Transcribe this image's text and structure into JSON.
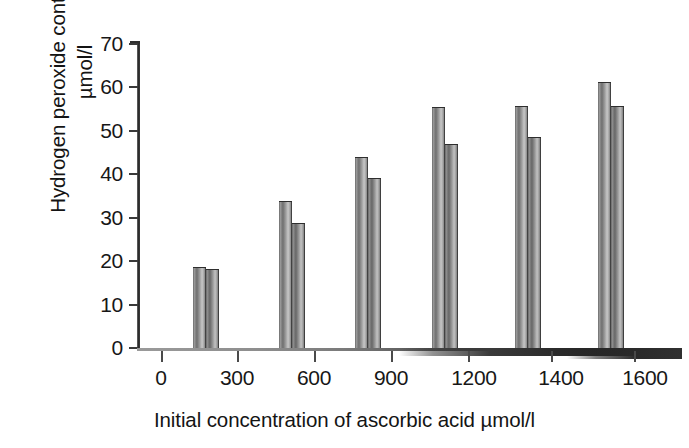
{
  "chart_data": {
    "type": "bar",
    "title": "",
    "subtitle": "",
    "ylabel_line1": "Hydrogen peroxide content of solution",
    "ylabel_line2": "µmol/l",
    "xlabel": "Initial concentration of ascorbic acid µmol/l",
    "categories": [
      "300",
      "600",
      "900",
      "1200",
      "1400",
      "1600"
    ],
    "xtick_labels": [
      "0",
      "300",
      "600",
      "900",
      "1200",
      "1400",
      "1600"
    ],
    "ytick_labels": [
      "0",
      "10",
      "20",
      "30",
      "40",
      "50",
      "60",
      "70"
    ],
    "ylim": [
      0,
      70
    ],
    "ytick_step": 10,
    "grid": false,
    "legend": "none",
    "series": [
      {
        "name": "series-1",
        "values": [
          18.4,
          33.6,
          43.8,
          55.3,
          55.5,
          61.0
        ]
      },
      {
        "name": "series-2",
        "values": [
          18.0,
          28.6,
          38.9,
          46.7,
          48.4,
          55.5
        ]
      }
    ],
    "colors": {
      "series_1": "#8f8f8f",
      "series_2": "#848484",
      "axis": "#2b2b2b",
      "text": "#171717"
    }
  },
  "figure": {
    "background": "#ffffff"
  }
}
